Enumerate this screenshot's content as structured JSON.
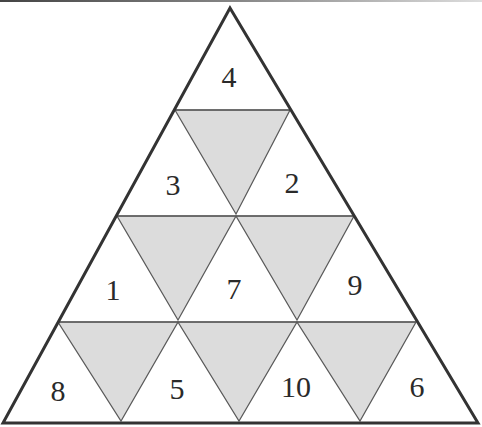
{
  "diagram": {
    "type": "triangular-number-grid",
    "rows": 4,
    "colors": {
      "outline": "#3a3a3a",
      "inner_line": "#5a5a5a",
      "shaded": "#dcdcdc",
      "background": "#ffffff",
      "number": "#2a2a2a"
    },
    "cells": [
      {
        "row": 1,
        "position": 1,
        "value": "4"
      },
      {
        "row": 2,
        "position": 1,
        "value": "3"
      },
      {
        "row": 2,
        "position": 2,
        "value": "2"
      },
      {
        "row": 3,
        "position": 1,
        "value": "1"
      },
      {
        "row": 3,
        "position": 2,
        "value": "7"
      },
      {
        "row": 3,
        "position": 3,
        "value": "9"
      },
      {
        "row": 4,
        "position": 1,
        "value": "8"
      },
      {
        "row": 4,
        "position": 2,
        "value": "5"
      },
      {
        "row": 4,
        "position": 3,
        "value": "10"
      },
      {
        "row": 4,
        "position": 4,
        "value": "6"
      }
    ],
    "shaded_inverted_triangles": 6
  }
}
